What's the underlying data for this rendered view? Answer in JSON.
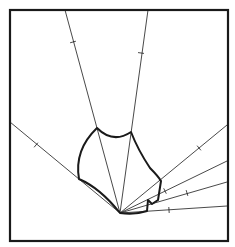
{
  "diagram": {
    "type": "geometric-line-figure",
    "background": "#ffffff",
    "stroke_color": "#1a1a1a",
    "frame": {
      "x": 10,
      "y": 10,
      "width": 218,
      "height": 231
    },
    "vertex": {
      "x": 120,
      "y": 213
    },
    "rays": [
      {
        "id": "left",
        "end": [
          10,
          122
        ],
        "tick": [
          36,
          145
        ]
      },
      {
        "id": "top-left",
        "end": [
          65,
          10
        ],
        "tick": [
          73,
          42
        ]
      },
      {
        "id": "top-right",
        "end": [
          148,
          10
        ],
        "tick": [
          141,
          53
        ]
      },
      {
        "id": "right-1",
        "end": [
          227,
          125
        ],
        "tick": [
          199,
          148
        ]
      },
      {
        "id": "right-2",
        "end": [
          227,
          161
        ],
        "tick": [
          165,
          191
        ]
      },
      {
        "id": "right-3",
        "end": [
          227,
          182
        ],
        "tick": [
          187,
          193
        ]
      },
      {
        "id": "right-4",
        "end": [
          227,
          206
        ],
        "tick": [
          169,
          210
        ]
      }
    ],
    "shape_path": "M 97 128 Q 113 144 131 132 Q 138 150 150 168 Q 158 176 161 181 L 158 200 L 152 204 L 148 200 L 147 211 Q 135 215 120 213 Q 100 188 79 179 Q 74 150 97 128 Z"
  }
}
